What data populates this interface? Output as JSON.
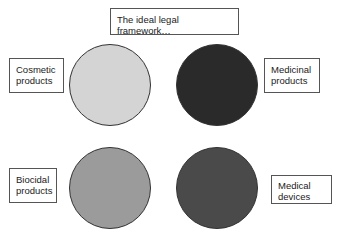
{
  "title": "The ideal legal framework…",
  "categories": [
    {
      "id": "cosmetic",
      "label": "Cosmetic products",
      "line1": "Cosmetic",
      "line2": "products",
      "color": "#d4d4d4"
    },
    {
      "id": "medicinal",
      "label": "Medicinal products",
      "line1": "Medicinal",
      "line2": "products",
      "color": "#2a2a2a"
    },
    {
      "id": "biocidal",
      "label": "Biocidal products",
      "line1": "Biocidal",
      "line2": "products",
      "color": "#9b9b9b"
    },
    {
      "id": "medical-devices",
      "label": "Medical devices",
      "line1": "Medical",
      "line2": "devices",
      "color": "#4a4a4a"
    }
  ]
}
